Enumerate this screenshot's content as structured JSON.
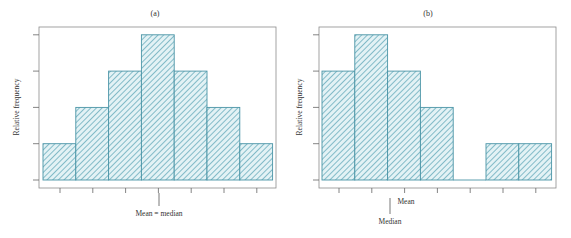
{
  "colors": {
    "bar_stroke": "#4a94a6",
    "bar_fill": "#e3f2f5",
    "hatch": "#5aa3b5",
    "axis": "#8c8c8c",
    "text": "#333333"
  },
  "chart_data": [
    {
      "type": "bar",
      "panel": "a",
      "title": "(a)",
      "xlabel": "",
      "ylabel": "Relative frequency",
      "categories": [
        "1",
        "2",
        "3",
        "4",
        "5",
        "6",
        "7"
      ],
      "values": [
        1,
        2,
        3,
        4,
        3,
        2,
        1
      ],
      "ylim": [
        0,
        4
      ],
      "y_ticks": 5,
      "x_ticks": 7,
      "grid": false,
      "hatched": true,
      "annotations": [
        {
          "text": "Mean = median",
          "x_position": 4
        }
      ]
    },
    {
      "type": "bar",
      "panel": "b",
      "title": "(b)",
      "xlabel": "",
      "ylabel": "Relative frequency",
      "categories": [
        "1",
        "2",
        "3",
        "4",
        "5",
        "6",
        "7"
      ],
      "values": [
        3,
        4,
        3,
        2,
        0,
        1,
        1
      ],
      "ylim": [
        0,
        4
      ],
      "y_ticks": 5,
      "x_ticks": 7,
      "grid": false,
      "hatched": true,
      "annotations": [
        {
          "text": "Mean",
          "x_position": 3.05
        },
        {
          "text": "Median",
          "x_position": 2.55
        }
      ]
    }
  ],
  "panels": {
    "a": {
      "title": "(a)",
      "ylabel": "Relative frequency",
      "annotation": "Mean = median"
    },
    "b": {
      "title": "(b)",
      "ylabel": "Relative frequency",
      "mean_label": "Mean",
      "median_label": "Median"
    }
  }
}
